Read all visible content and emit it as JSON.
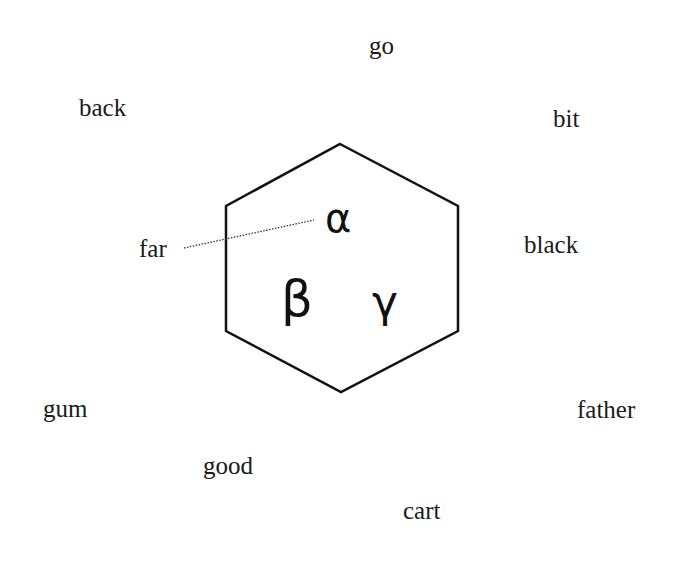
{
  "diagram": {
    "shape": "hexagon",
    "stroke_color": "#111111",
    "vertices": [
      [
        340,
        144
      ],
      [
        458,
        206
      ],
      [
        458,
        331
      ],
      [
        341,
        392
      ],
      [
        226,
        331
      ],
      [
        226,
        206
      ]
    ],
    "greek_letters": [
      {
        "id": "alpha",
        "symbol": "α"
      },
      {
        "id": "beta",
        "symbol": "β"
      },
      {
        "id": "gamma",
        "symbol": "γ"
      }
    ],
    "connector": {
      "from": "far",
      "to": "alpha",
      "style": "dotted"
    },
    "words": [
      {
        "id": "go",
        "text": "go"
      },
      {
        "id": "back",
        "text": "back"
      },
      {
        "id": "bit",
        "text": "bit"
      },
      {
        "id": "far",
        "text": "far"
      },
      {
        "id": "black",
        "text": "black"
      },
      {
        "id": "gum",
        "text": "gum"
      },
      {
        "id": "father",
        "text": "father"
      },
      {
        "id": "good",
        "text": "good"
      },
      {
        "id": "cart",
        "text": "cart"
      }
    ]
  }
}
